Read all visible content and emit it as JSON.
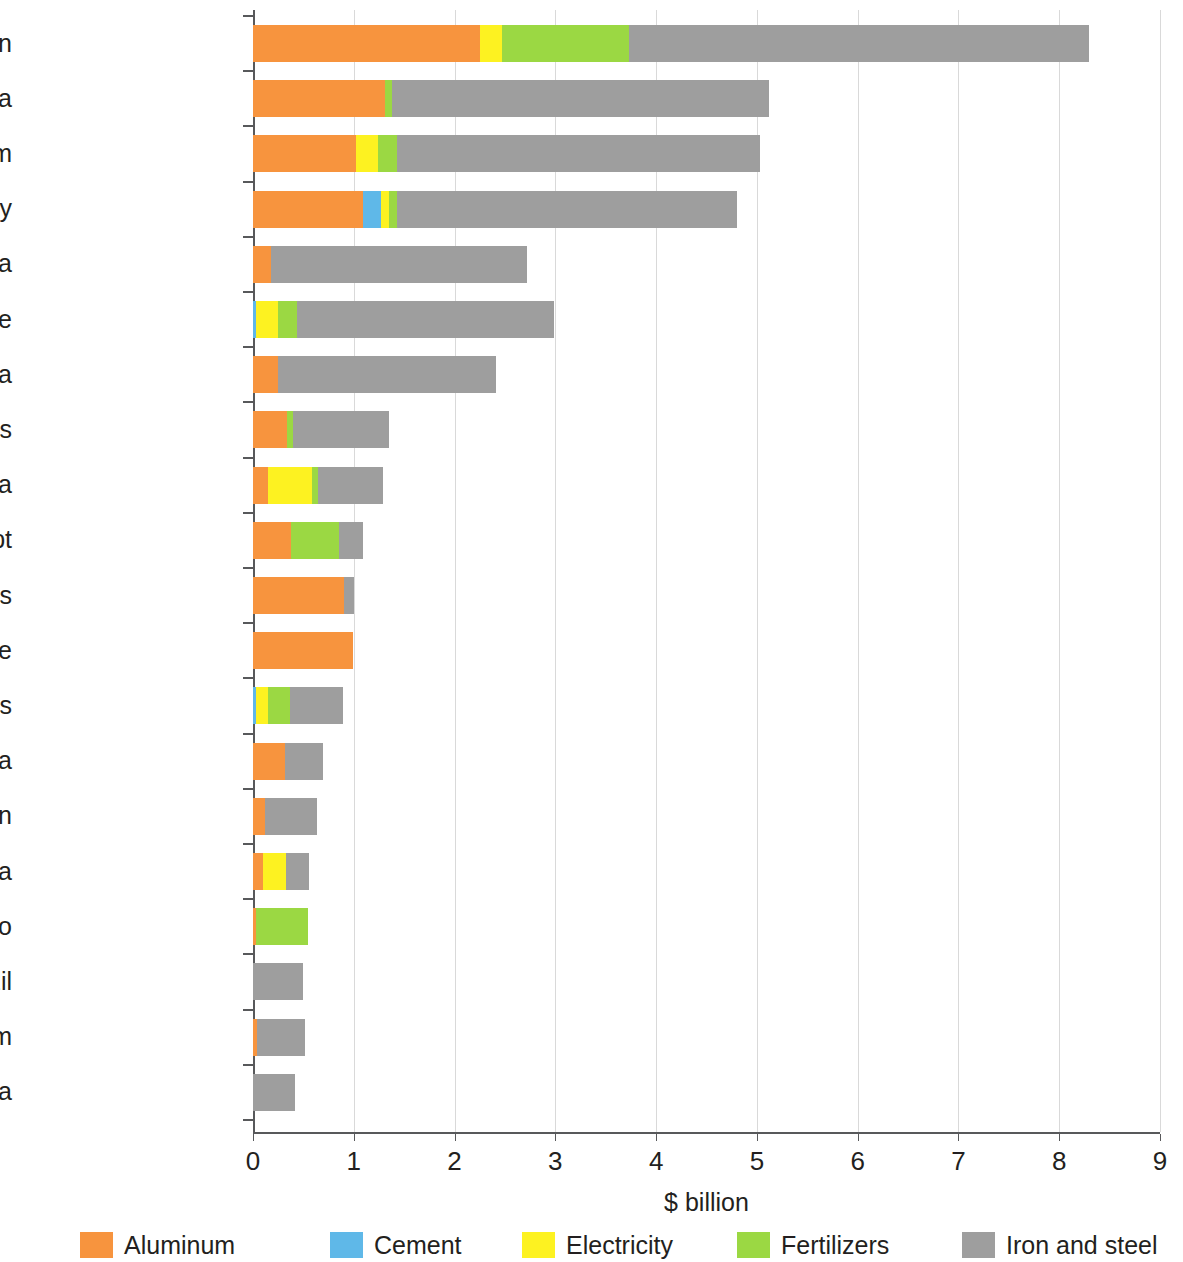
{
  "chart_data": {
    "type": "bar",
    "orientation": "horizontal",
    "stacked": true,
    "title": "",
    "subtitle": "",
    "xlabel": "$ billion",
    "ylabel": "",
    "xlim": [
      0,
      9
    ],
    "xticks": [
      0,
      1,
      2,
      3,
      4,
      5,
      6,
      7,
      8,
      9
    ],
    "xtick_labels": [
      "0",
      "1",
      "2",
      "3",
      "4",
      "5",
      "6",
      "7",
      "8",
      "9"
    ],
    "grid": "vertical",
    "legend_position": "bottom",
    "categories": [
      "Russian Federation",
      "People’s Republic of China",
      "United Kingdom",
      "Turkey",
      "Republic of Korea",
      "Ukraine",
      "India",
      "United States",
      "Serbia",
      "Egypt",
      "United Arab Emirates",
      "Mozambique",
      "Belarus",
      "South Africa",
      "Japan",
      "Bosnia Herzegovina",
      "Morocco",
      "Brazil",
      "Viet Nam",
      "Indonesia"
    ],
    "series": [
      {
        "name": "Aluminum",
        "color": "#F7943E",
        "values": [
          2.25,
          1.31,
          1.02,
          1.09,
          0.18,
          0.0,
          0.25,
          0.34,
          0.15,
          0.38,
          0.9,
          0.99,
          0.0,
          0.32,
          0.12,
          0.1,
          0.03,
          0.0,
          0.04,
          0.0
        ]
      },
      {
        "name": "Cement",
        "color": "#5FB8E8",
        "values": [
          0.0,
          0.0,
          0.0,
          0.18,
          0.0,
          0.03,
          0.0,
          0.0,
          0.0,
          0.0,
          0.0,
          0.0,
          0.03,
          0.0,
          0.0,
          0.0,
          0.0,
          0.0,
          0.0,
          0.0
        ]
      },
      {
        "name": "Electricity",
        "color": "#FDF221",
        "values": [
          0.22,
          0.0,
          0.22,
          0.08,
          0.0,
          0.22,
          0.0,
          0.0,
          0.44,
          0.0,
          0.0,
          0.0,
          0.12,
          0.0,
          0.0,
          0.23,
          0.0,
          0.0,
          0.0,
          0.0
        ]
      },
      {
        "name": "Fertilizers",
        "color": "#9BD843",
        "values": [
          1.26,
          0.07,
          0.19,
          0.08,
          0.0,
          0.19,
          0.0,
          0.06,
          0.06,
          0.47,
          0.0,
          0.0,
          0.22,
          0.0,
          0.0,
          0.0,
          0.52,
          0.0,
          0.0,
          0.0
        ]
      },
      {
        "name": "Iron and steel",
        "color": "#9E9E9E",
        "values": [
          4.57,
          3.74,
          3.6,
          3.37,
          2.54,
          2.55,
          2.16,
          0.95,
          0.64,
          0.24,
          0.1,
          0.0,
          0.52,
          0.37,
          0.52,
          0.23,
          0.0,
          0.5,
          0.48,
          0.42
        ]
      }
    ],
    "totals": [
      8.3,
      5.12,
      5.03,
      4.8,
      2.72,
      2.99,
      2.41,
      1.35,
      1.29,
      1.09,
      1.0,
      0.99,
      0.89,
      0.69,
      0.64,
      0.56,
      0.55,
      0.5,
      0.52,
      0.42
    ]
  },
  "legend": {
    "items": [
      {
        "label": "Aluminum",
        "color": "#F7943E"
      },
      {
        "label": "Cement",
        "color": "#5FB8E8"
      },
      {
        "label": "Electricity",
        "color": "#FDF221"
      },
      {
        "label": "Fertilizers",
        "color": "#9BD843"
      },
      {
        "label": "Iron and steel",
        "color": "#9E9E9E"
      }
    ]
  }
}
